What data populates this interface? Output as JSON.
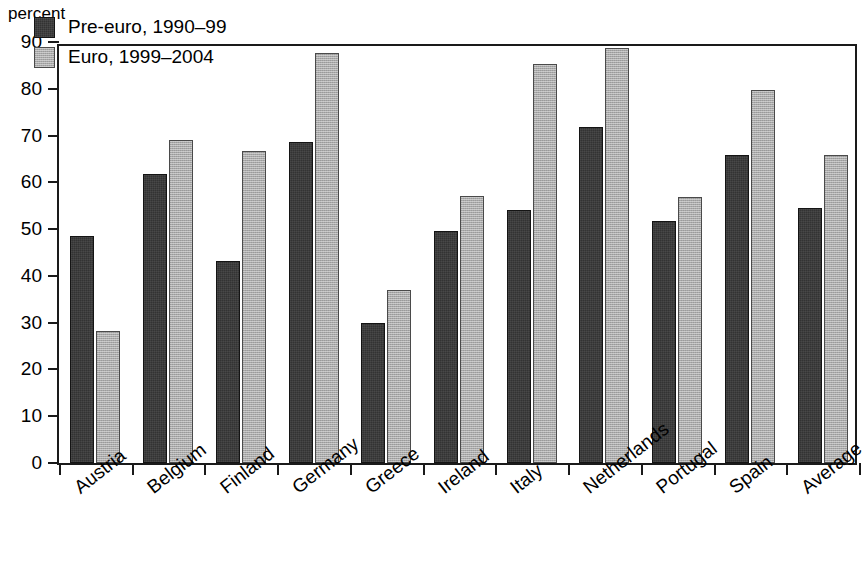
{
  "axis": {
    "unit_label": "percent",
    "y_ticks": [
      "0",
      "10",
      "20",
      "30",
      "40",
      "50",
      "60",
      "70",
      "80",
      "90"
    ],
    "y_min": 0,
    "y_max": 90,
    "y_step": 10
  },
  "legend": {
    "entries": [
      {
        "label": "Pre-euro, 1990–99",
        "color": "#333333",
        "key": "pre"
      },
      {
        "label": "Euro, 1999–2004",
        "color": "#a9a9a9",
        "key": "euro"
      }
    ]
  },
  "chart_data": {
    "type": "bar",
    "title": "",
    "xlabel": "",
    "ylabel": "percent",
    "ylim": [
      0,
      90
    ],
    "grid": false,
    "legend_position": "top-left-inside",
    "categories": [
      "Austria",
      "Belgium",
      "Finland",
      "Germany",
      "Greece",
      "Ireland",
      "Italy",
      "Netherlands",
      "Portugal",
      "Spain",
      "Average"
    ],
    "series": [
      {
        "name": "Pre-euro, 1990–99",
        "color": "#333333",
        "values": [
          48.6,
          61.8,
          43.2,
          68.6,
          30.0,
          49.6,
          54.0,
          71.9,
          51.8,
          65.8,
          54.5
        ]
      },
      {
        "name": "Euro, 1999–2004",
        "color": "#a9a9a9",
        "values": [
          28.3,
          69.1,
          66.6,
          87.6,
          37.0,
          57.0,
          85.4,
          88.7,
          56.9,
          79.8,
          65.8
        ]
      }
    ]
  }
}
